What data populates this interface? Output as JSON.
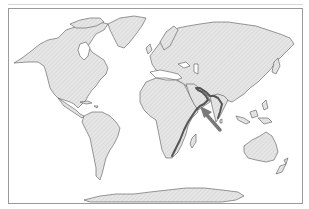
{
  "map": {
    "type": "world-outline",
    "projection": "equirectangular-like",
    "colors": {
      "land_fill": "#e6e6e6",
      "hatch": "#cfcfcf",
      "coastline": "#555555",
      "highlight": "#555555",
      "arrow": "#7a7a7a",
      "frame": "#9a9a9a",
      "ocean": "#ffffff"
    },
    "regions": [
      {
        "name": "north-america"
      },
      {
        "name": "greenland"
      },
      {
        "name": "south-america"
      },
      {
        "name": "europe-asia"
      },
      {
        "name": "africa"
      },
      {
        "name": "madagascar"
      },
      {
        "name": "australia"
      },
      {
        "name": "new-zealand"
      },
      {
        "name": "antarctica"
      },
      {
        "name": "southeast-asia-islands"
      }
    ],
    "highlight": {
      "description": "thick coastline from East Africa around Arabian Peninsula and Persian Gulf to western India",
      "arrow_direction": "up-left",
      "arrow_target": "arabian-sea"
    }
  }
}
